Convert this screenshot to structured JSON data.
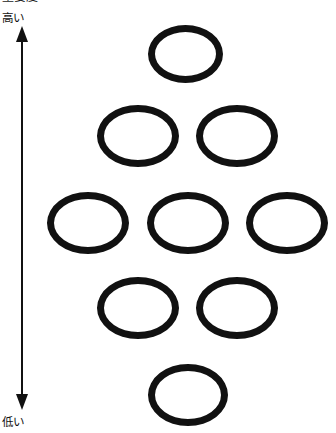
{
  "figure": {
    "top_caption": "重要度",
    "axis": {
      "name": "vertical-importance-axis",
      "type": "double-headed-arrow",
      "orientation": "vertical",
      "top_label": "高い",
      "bottom_label": "低い",
      "color": "#111111"
    },
    "node_style": {
      "shape": "ellipse",
      "fill": "none",
      "stroke_color": "#111111",
      "stroke_width_px": 7
    },
    "layout": {
      "description": "diamond arrangement",
      "rows_counts": [
        1,
        2,
        3,
        2,
        1
      ],
      "total_nodes": 9
    },
    "nodes": [
      {
        "id": "node-r1-c1",
        "row": 1,
        "col": 1,
        "label": "",
        "x": 148,
        "y": 25,
        "w": 75,
        "h": 58
      },
      {
        "id": "node-r2-c1",
        "row": 2,
        "col": 1,
        "label": "",
        "x": 97,
        "y": 105,
        "w": 82,
        "h": 62
      },
      {
        "id": "node-r2-c2",
        "row": 2,
        "col": 2,
        "label": "",
        "x": 196,
        "y": 105,
        "w": 82,
        "h": 62
      },
      {
        "id": "node-r3-c1",
        "row": 3,
        "col": 1,
        "label": "",
        "x": 47,
        "y": 192,
        "w": 82,
        "h": 62
      },
      {
        "id": "node-r3-c2",
        "row": 3,
        "col": 2,
        "label": "",
        "x": 147,
        "y": 192,
        "w": 82,
        "h": 62
      },
      {
        "id": "node-r3-c3",
        "row": 3,
        "col": 3,
        "label": "",
        "x": 246,
        "y": 192,
        "w": 82,
        "h": 62
      },
      {
        "id": "node-r4-c1",
        "row": 4,
        "col": 1,
        "label": "",
        "x": 97,
        "y": 277,
        "w": 82,
        "h": 62
      },
      {
        "id": "node-r4-c2",
        "row": 4,
        "col": 2,
        "label": "",
        "x": 196,
        "y": 277,
        "w": 82,
        "h": 62
      },
      {
        "id": "node-r5-c1",
        "row": 5,
        "col": 1,
        "label": "",
        "x": 148,
        "y": 364,
        "w": 80,
        "h": 62
      }
    ]
  }
}
